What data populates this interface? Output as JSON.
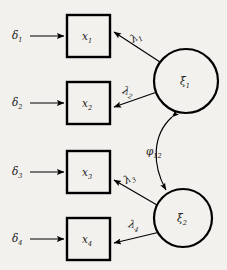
{
  "diagram": {
    "type": "sem-path-diagram",
    "background_color": "#f2f1ee",
    "line_color": "#000000",
    "errors": [
      {
        "id": "delta1",
        "symbol": "δ",
        "subscript": "1",
        "label": "δ₁"
      },
      {
        "id": "delta2",
        "symbol": "δ",
        "subscript": "2",
        "label": "δ₂"
      },
      {
        "id": "delta3",
        "symbol": "δ",
        "subscript": "3",
        "label": "δ₃"
      },
      {
        "id": "delta4",
        "symbol": "δ",
        "subscript": "4",
        "label": "δ₄"
      }
    ],
    "indicators": [
      {
        "id": "x1",
        "symbol": "x",
        "subscript": "1",
        "label": "x₁",
        "shape": "rectangle"
      },
      {
        "id": "x2",
        "symbol": "x",
        "subscript": "2",
        "label": "x₂",
        "shape": "rectangle"
      },
      {
        "id": "x3",
        "symbol": "x",
        "subscript": "3",
        "label": "x₃",
        "shape": "rectangle"
      },
      {
        "id": "x4",
        "symbol": "x",
        "subscript": "4",
        "label": "x₄",
        "shape": "rectangle"
      }
    ],
    "factors": [
      {
        "id": "xi1",
        "symbol": "ξ",
        "subscript": "1",
        "label": "ξ₁",
        "shape": "circle"
      },
      {
        "id": "xi2",
        "symbol": "ξ",
        "subscript": "2",
        "label": "ξ₂",
        "shape": "circle"
      }
    ],
    "loadings": [
      {
        "id": "lambda1",
        "symbol": "λ",
        "subscript": "1",
        "label": "λ₁",
        "from": "xi1",
        "to": "x1"
      },
      {
        "id": "lambda2",
        "symbol": "λ",
        "subscript": "2",
        "label": "λ₂",
        "from": "xi1",
        "to": "x2"
      },
      {
        "id": "lambda3",
        "symbol": "λ",
        "subscript": "3",
        "label": "λ₃",
        "from": "xi2",
        "to": "x3"
      },
      {
        "id": "lambda4",
        "symbol": "λ",
        "subscript": "4",
        "label": "λ₄",
        "from": "xi2",
        "to": "x4"
      }
    ],
    "covariance": {
      "id": "phi12",
      "symbol": "φ",
      "subscript": "12",
      "label": "φ₁₂",
      "between": [
        "xi1",
        "xi2"
      ],
      "arrow": "double-headed"
    }
  }
}
